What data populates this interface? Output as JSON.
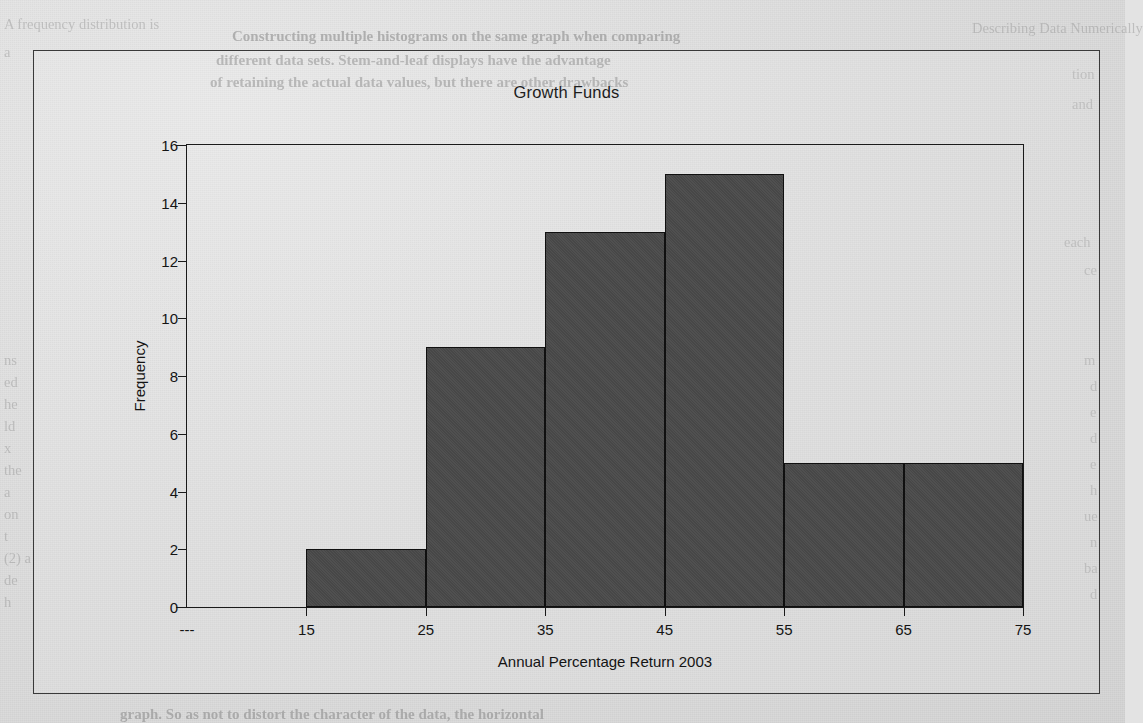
{
  "page": {
    "background_color": "#dedede",
    "bleed_through_lines": [
      {
        "text": "Constructing multiple histograms on the same graph when comparing",
        "x": 232,
        "y": 28,
        "style": "head"
      },
      {
        "text": "different data sets. Stem-and-leaf displays have the advantage",
        "x": 216,
        "y": 52,
        "style": "head"
      },
      {
        "text": "of retaining the actual data values, but there are other drawbacks",
        "x": 210,
        "y": 74,
        "style": "head"
      },
      {
        "text": "A frequency distribution is",
        "x": 4,
        "y": 16,
        "style": "side"
      },
      {
        "text": "a",
        "x": 4,
        "y": 44,
        "style": "side"
      },
      {
        "text": "ns",
        "x": 4,
        "y": 352,
        "style": "side"
      },
      {
        "text": "ed",
        "x": 4,
        "y": 374,
        "style": "side"
      },
      {
        "text": "he",
        "x": 4,
        "y": 396,
        "style": "side"
      },
      {
        "text": "ld",
        "x": 4,
        "y": 418,
        "style": "side"
      },
      {
        "text": "x",
        "x": 4,
        "y": 440,
        "style": "side"
      },
      {
        "text": "the",
        "x": 4,
        "y": 462,
        "style": "side"
      },
      {
        "text": "a",
        "x": 4,
        "y": 484,
        "style": "side"
      },
      {
        "text": "on",
        "x": 4,
        "y": 506,
        "style": "side"
      },
      {
        "text": "t",
        "x": 4,
        "y": 528,
        "style": "side"
      },
      {
        "text": "(2) a",
        "x": 4,
        "y": 550,
        "style": "side"
      },
      {
        "text": "de",
        "x": 4,
        "y": 572,
        "style": "side"
      },
      {
        "text": "h",
        "x": 4,
        "y": 594,
        "style": "side"
      },
      {
        "text": "graph. So as not to distort the character of the data, the horizontal",
        "x": 120,
        "y": 706,
        "style": "head"
      },
      {
        "text": "Describing Data Numerically",
        "x": 972,
        "y": 20,
        "style": "side"
      },
      {
        "text": "tion",
        "x": 1072,
        "y": 66,
        "style": "side"
      },
      {
        "text": "and",
        "x": 1072,
        "y": 96,
        "style": "side"
      },
      {
        "text": "each",
        "x": 1064,
        "y": 234,
        "style": "side"
      },
      {
        "text": "ce",
        "x": 1084,
        "y": 262,
        "style": "side"
      },
      {
        "text": "m",
        "x": 1084,
        "y": 352,
        "style": "side"
      },
      {
        "text": "d",
        "x": 1090,
        "y": 378,
        "style": "side"
      },
      {
        "text": "e",
        "x": 1090,
        "y": 404,
        "style": "side"
      },
      {
        "text": "d",
        "x": 1090,
        "y": 430,
        "style": "side"
      },
      {
        "text": "e",
        "x": 1090,
        "y": 456,
        "style": "side"
      },
      {
        "text": "h",
        "x": 1090,
        "y": 482,
        "style": "side"
      },
      {
        "text": "ue",
        "x": 1084,
        "y": 508,
        "style": "side"
      },
      {
        "text": "n",
        "x": 1090,
        "y": 534,
        "style": "side"
      },
      {
        "text": "ba",
        "x": 1084,
        "y": 560,
        "style": "side"
      },
      {
        "text": "d",
        "x": 1090,
        "y": 586,
        "style": "side"
      }
    ]
  },
  "chart_data": {
    "type": "bar",
    "title": "Growth Funds",
    "xlabel": "Annual Percentage Return 2003",
    "ylabel": "Frequency",
    "grid": false,
    "legend": "none",
    "bar_color": "#4a4a4a",
    "bar_edge_color": "#101010",
    "ylim": [
      0,
      16
    ],
    "yticks": [
      0,
      2,
      4,
      6,
      8,
      10,
      12,
      14,
      16
    ],
    "ytick_labels": [
      "0",
      "2",
      "4",
      "6",
      "8",
      "10",
      "12",
      "14",
      "16"
    ],
    "xtick_labels": [
      "---",
      "15",
      "25",
      "35",
      "45",
      "55",
      "65",
      "75"
    ],
    "xtick_positions": [
      0,
      1,
      2,
      3,
      4,
      5,
      6,
      7
    ],
    "bin_edges_index": [
      1,
      2,
      3,
      4,
      5,
      6,
      7
    ],
    "categories": [
      "10-20",
      "20-30",
      "30-40",
      "40-50",
      "50-60",
      "60-70"
    ],
    "values": [
      2,
      9,
      13,
      15,
      5,
      5
    ],
    "bars": [
      {
        "label": "10-20",
        "left_index": 1,
        "right_index": 2,
        "value": 2
      },
      {
        "label": "20-30",
        "left_index": 2,
        "right_index": 3,
        "value": 9
      },
      {
        "label": "30-40",
        "left_index": 3,
        "right_index": 4,
        "value": 13
      },
      {
        "label": "40-50",
        "left_index": 4,
        "right_index": 5,
        "value": 15
      },
      {
        "label": "50-60",
        "left_index": 5,
        "right_index": 6,
        "value": 5
      },
      {
        "label": "60-70",
        "left_index": 6,
        "right_index": 7,
        "value": 5
      }
    ]
  }
}
